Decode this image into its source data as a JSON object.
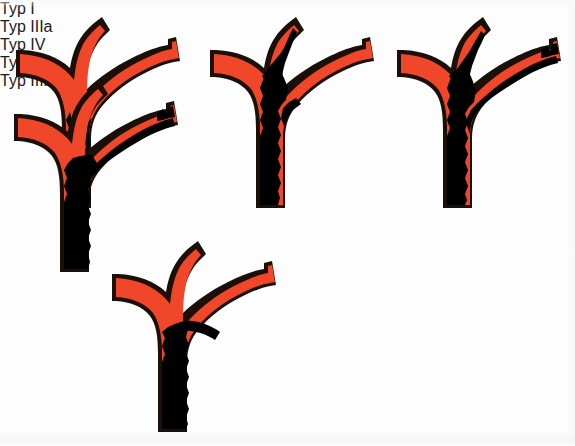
{
  "figure": {
    "kind": "medical-classification-diagram",
    "colors": {
      "vessel_fill": "#F0462A",
      "vessel_outline": "#1a1008",
      "tumor_fill": "#000000",
      "background": "#fdfdfd",
      "label_text": "#1a1a1a"
    }
  },
  "panels": [
    {
      "id": "typ-1",
      "label": "Typ I",
      "tumor_extent": "common-duct-trunk-below-bifurcation"
    },
    {
      "id": "typ-3a",
      "label": "Typ IIIa",
      "tumor_extent": "trunk-plus-right-hepatic-branch"
    },
    {
      "id": "typ-4",
      "label": "Typ IV",
      "tumor_extent": "trunk-plus-both-branches-full-length"
    },
    {
      "id": "typ-2",
      "label": "Typ II",
      "tumor_extent": "trunk-up-to-bifurcation"
    },
    {
      "id": "typ-3b",
      "label": "Typ IIIb",
      "tumor_extent": "trunk-plus-left-hepatic-branch"
    }
  ]
}
